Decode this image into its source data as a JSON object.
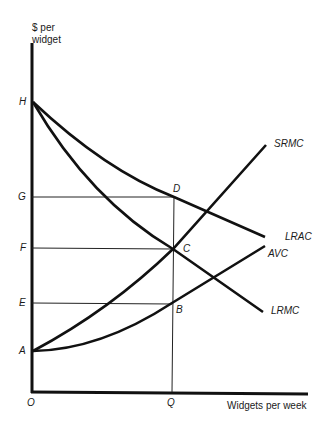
{
  "axes": {
    "y_title_line1": "$ per",
    "y_title_line2": "widget",
    "x_title": "Widgets per week",
    "origin": "O"
  },
  "y_labels": {
    "H": "H",
    "G": "G",
    "F": "F",
    "E": "E",
    "A": "A"
  },
  "x_labels": {
    "Q": "Q"
  },
  "points": {
    "D": "D",
    "C": "C",
    "B": "B"
  },
  "curves": {
    "srmc": "SRMC",
    "lrac": "LRAC",
    "avc": "AVC",
    "lrmc": "LRMC"
  },
  "colors": {
    "ink": "#111111",
    "background": "#ffffff"
  }
}
